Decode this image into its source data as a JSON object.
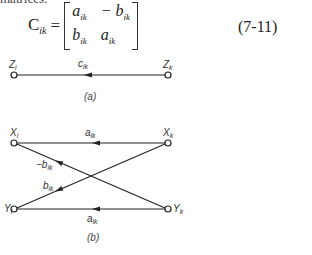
{
  "text": {
    "top_fragment": "matrices:"
  },
  "equation": {
    "lhs": "C",
    "lhs_sub": "ik",
    "equals": "=",
    "matrix": [
      [
        "a",
        "ik",
        "− b",
        "ik"
      ],
      [
        "b",
        "ik",
        "a",
        "ik"
      ]
    ],
    "m00": "a",
    "m00s": "ik",
    "m01": "− b",
    "m01s": "ik",
    "m10": "b",
    "m10s": "ik",
    "m11": "a",
    "m11s": "ik",
    "number": "(7-11)"
  },
  "figure_a": {
    "caption": "(a)",
    "node_left": "Z",
    "node_left_sub": "i",
    "node_right": "Z",
    "node_right_sub": "k",
    "edge_label": "c",
    "edge_label_sub": "ik"
  },
  "figure_b": {
    "caption": "(b)",
    "nodes": {
      "xi": "X",
      "xi_sub": "i",
      "xk": "X",
      "xk_sub": "k",
      "yi": "Y",
      "yi_sub": "i",
      "yk": "Y",
      "yk_sub": "k"
    },
    "edges": {
      "top": "a",
      "top_sub": "ik",
      "bottom": "a",
      "bottom_sub": "ik",
      "diag_neg": "−b",
      "diag_neg_sub": "ik",
      "diag_pos": "b",
      "diag_pos_sub": "ik"
    }
  }
}
